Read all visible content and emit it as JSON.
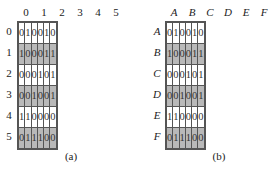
{
  "panels": [
    {
      "id": "a",
      "caption": "(a)",
      "column_labels": [
        "0",
        "1",
        "2",
        "3",
        "4",
        "5"
      ],
      "row_labels": [
        "0",
        "1",
        "2",
        "3",
        "4",
        "5"
      ],
      "matrix": [
        [
          "0",
          "1",
          "0",
          "0",
          "1",
          "0"
        ],
        [
          "1",
          "0",
          "0",
          "0",
          "1",
          "1"
        ],
        [
          "0",
          "0",
          "0",
          "1",
          "0",
          "1"
        ],
        [
          "0",
          "0",
          "1",
          "0",
          "0",
          "1"
        ],
        [
          "1",
          "1",
          "0",
          "0",
          "0",
          "0"
        ],
        [
          "0",
          "1",
          "1",
          "1",
          "0",
          "0"
        ]
      ],
      "shaded_rows": [
        1,
        3,
        5
      ]
    },
    {
      "id": "b",
      "caption": "(b)",
      "column_labels": [
        "A",
        "B",
        "C",
        "D",
        "E",
        "F"
      ],
      "row_labels": [
        "A",
        "B",
        "C",
        "D",
        "E",
        "F"
      ],
      "matrix": [
        [
          "0",
          "1",
          "0",
          "0",
          "1",
          "0"
        ],
        [
          "1",
          "0",
          "0",
          "0",
          "1",
          "1"
        ],
        [
          "0",
          "0",
          "0",
          "1",
          "0",
          "1"
        ],
        [
          "0",
          "0",
          "1",
          "0",
          "0",
          "1"
        ],
        [
          "1",
          "1",
          "0",
          "0",
          "0",
          "0"
        ],
        [
          "0",
          "1",
          "1",
          "1",
          "0",
          "0"
        ]
      ],
      "shaded_rows": [
        1,
        3,
        5
      ]
    }
  ],
  "colors": {
    "shade": "#b9b9b9",
    "grid_line": "#555555",
    "background": "#ffffff"
  }
}
